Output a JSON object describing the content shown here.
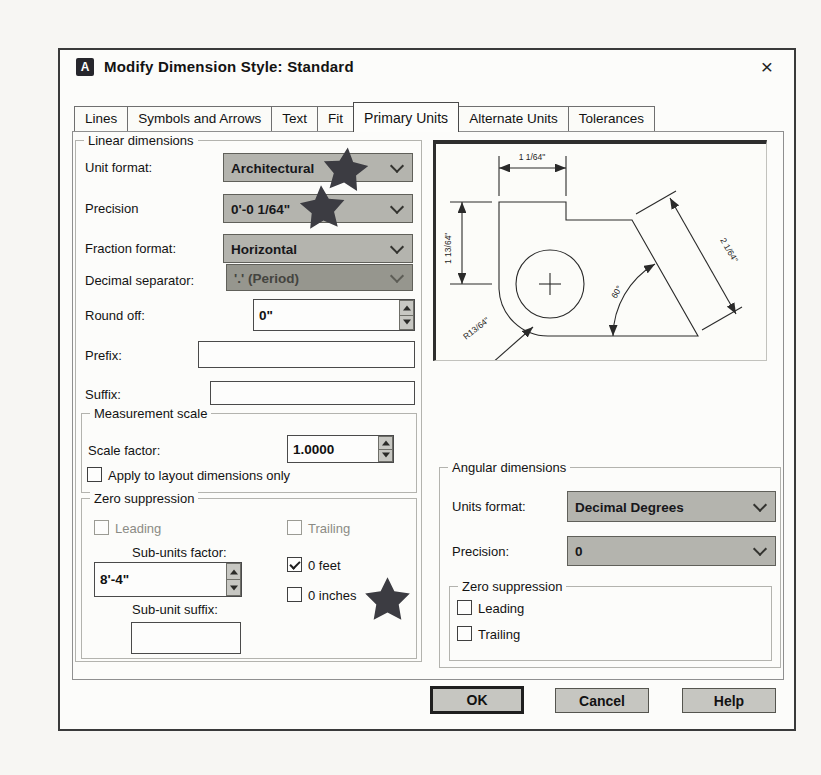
{
  "window": {
    "title": "Modify Dimension Style: Standard",
    "icon_letter": "A",
    "close_glyph": "×"
  },
  "tabs": [
    "Lines",
    "Symbols and Arrows",
    "Text",
    "Fit",
    "Primary Units",
    "Alternate Units",
    "Tolerances"
  ],
  "active_tab": "Primary Units",
  "linear": {
    "legend": "Linear dimensions",
    "unit_format": {
      "label": "Unit format:",
      "value": "Architectural"
    },
    "precision": {
      "label": "Precision",
      "value": "0'-0 1/64\""
    },
    "fraction_format": {
      "label": "Fraction format:",
      "value": "Horizontal"
    },
    "decimal_separator": {
      "label": "Decimal separator:",
      "value": "'.' (Period)"
    },
    "round_off": {
      "label": "Round off:",
      "value": "0\""
    },
    "prefix": {
      "label": "Prefix:",
      "value": ""
    },
    "suffix": {
      "label": "Suffix:",
      "value": ""
    }
  },
  "measurement": {
    "legend": "Measurement scale",
    "scale_factor": {
      "label": "Scale factor:",
      "value": "1.0000"
    },
    "apply_layout": {
      "label": "Apply to layout dimensions only"
    }
  },
  "zero_suppression": {
    "legend": "Zero suppression",
    "leading": "Leading",
    "trailing": "Trailing",
    "sub_units_factor": {
      "label": "Sub-units factor:",
      "value": "8'-4\""
    },
    "sub_unit_suffix": {
      "label": "Sub-unit suffix:",
      "value": ""
    },
    "zero_feet": "0 feet",
    "zero_inches": "0 inches"
  },
  "angular": {
    "legend": "Angular dimensions",
    "units_format": {
      "label": "Units format:",
      "value": "Decimal Degrees"
    },
    "precision": {
      "label": "Precision:",
      "value": "0"
    },
    "zero_suppression": {
      "legend": "Zero suppression",
      "leading": "Leading",
      "trailing": "Trailing"
    }
  },
  "preview": {
    "dim_top": "1 1/64\"",
    "dim_left": "1 13/64\"",
    "dim_diagonal": "2 1/64\"",
    "dim_angle": "60°",
    "dim_radius": "R13/64\""
  },
  "buttons": {
    "ok": "OK",
    "cancel": "Cancel",
    "help": "Help"
  },
  "colors": {
    "dropdown_fill": "#b4b4ae",
    "disabled_fill": "#96968e",
    "star": "#3c3c42",
    "button_fill": "#c6c6c1"
  }
}
